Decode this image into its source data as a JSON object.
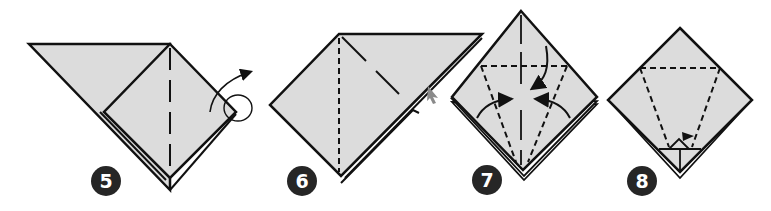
{
  "diagram": {
    "colors": {
      "paper_fill": "#dcdcdc",
      "stroke": "#111111",
      "badge_bg": "#262626",
      "badge_text": "#ffffff",
      "background": "#ffffff",
      "cursor_grey": "#8a8a8a"
    },
    "steps": [
      {
        "number": "5",
        "action": "Mountain-fold flap behind along vertical crease"
      },
      {
        "number": "6",
        "action": "Valley fold along vertical dashed line; flip indicator on right edge"
      },
      {
        "number": "7",
        "action": "Fold top down and both sides in to center along dashed lines"
      },
      {
        "number": "8",
        "action": "Fold along dashed trapezoid; small triangle flap at bottom"
      }
    ]
  }
}
